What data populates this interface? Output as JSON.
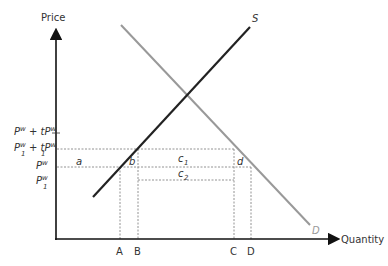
{
  "diagram": {
    "type": "supply-demand-tariff",
    "axes": {
      "y_label": "Price",
      "x_label": "Quantity"
    },
    "curves": {
      "supply_label": "S",
      "demand_label": "D",
      "supply_color": "#222222",
      "demand_color": "#999999"
    },
    "price_levels": {
      "tariff_price": {
        "main": "P",
        "sup": "w",
        "plus": " + t",
        "main2": "P",
        "sup2": "w"
      },
      "tariff_price_1": {
        "main": "P",
        "sub": "1",
        "sup": "w",
        "plus": " + t",
        "main2": "P",
        "sub2": "1",
        "sup2": "w"
      },
      "world_price": {
        "main": "P",
        "sup": "w"
      },
      "world_price_1": {
        "main": "P",
        "sub": "1",
        "sup": "w"
      }
    },
    "quantities": [
      "A",
      "B",
      "C",
      "D"
    ],
    "areas": {
      "a": "a",
      "b": "b",
      "c1_main": "c",
      "c1_sub": "1",
      "c2_main": "c",
      "c2_sub": "2",
      "d": "d"
    }
  }
}
